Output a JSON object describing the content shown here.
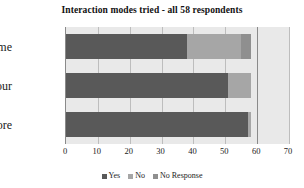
{
  "chart_data": {
    "type": "bar",
    "orientation": "horizontal",
    "stacked": true,
    "title": "Interaction modes tried - all 58 respondents",
    "xlabel": "",
    "ylabel": "",
    "categories": [
      "Explore",
      "Tour",
      "Game"
    ],
    "categories_top_to_bottom": [
      "Game",
      "Tour",
      "Explore"
    ],
    "series": [
      {
        "name": "Yes",
        "color": "#595959",
        "values": [
          57,
          51,
          38
        ]
      },
      {
        "name": "No",
        "color": "#a6a6a6",
        "values": [
          1,
          7,
          17
        ]
      },
      {
        "name": "No Response",
        "color": "#8f8f8f",
        "values": [
          0,
          0,
          3
        ]
      }
    ],
    "totals": [
      58,
      58,
      58
    ],
    "xlim": [
      0,
      70
    ],
    "xticks": [
      0,
      10,
      20,
      30,
      40,
      50,
      60,
      70
    ],
    "xtick_labels": [
      "0",
      "10",
      "20",
      "30",
      "40",
      "50",
      "60",
      "70"
    ],
    "grid": true,
    "grid_axis": "x",
    "legend": [
      "Yes",
      "No",
      "No Response"
    ],
    "legend_position": "bottom",
    "plot_background": "#e9e9e9"
  },
  "legend_items": [
    {
      "label": "Yes",
      "color": "#595959"
    },
    {
      "label": "No",
      "color": "#a6a6a6"
    },
    {
      "label": "No Response",
      "color": "#8f8f8f"
    }
  ],
  "rows": [
    {
      "label": "Game",
      "segments": [
        {
          "name": "Yes",
          "value": 38,
          "color": "#595959"
        },
        {
          "name": "No",
          "value": 17,
          "color": "#a6a6a6"
        },
        {
          "name": "No Response",
          "value": 3,
          "color": "#8f8f8f"
        }
      ]
    },
    {
      "label": "Tour",
      "segments": [
        {
          "name": "Yes",
          "value": 51,
          "color": "#595959"
        },
        {
          "name": "No",
          "value": 7,
          "color": "#a6a6a6"
        },
        {
          "name": "No Response",
          "value": 0,
          "color": "#8f8f8f"
        }
      ]
    },
    {
      "label": "Explore",
      "segments": [
        {
          "name": "Yes",
          "value": 57,
          "color": "#595959"
        },
        {
          "name": "No",
          "value": 1,
          "color": "#a6a6a6"
        },
        {
          "name": "No Response",
          "value": 0,
          "color": "#8f8f8f"
        }
      ]
    }
  ]
}
